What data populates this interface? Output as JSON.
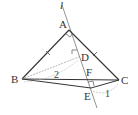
{
  "diagram": {
    "type": "geometry",
    "points": {
      "A": {
        "label": "A",
        "x": 69,
        "y": 30
      },
      "B": {
        "label": "B",
        "x": 22,
        "y": 79
      },
      "C": {
        "label": "C",
        "x": 119,
        "y": 80
      },
      "D": {
        "label": "D",
        "x": 79,
        "y": 57
      },
      "E": {
        "label": "E",
        "x": 91,
        "y": 88
      },
      "F": {
        "label": "F",
        "x": 87,
        "y": 79
      }
    },
    "line_label": "l",
    "measures": {
      "BD": "2",
      "CE": "1"
    },
    "colors": {
      "stroke": "#333333",
      "dashed": "#999999"
    }
  }
}
